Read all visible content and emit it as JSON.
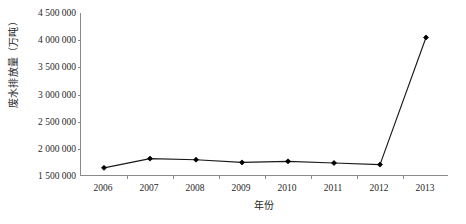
{
  "chart_data": {
    "type": "line",
    "title": "",
    "subtitle": "",
    "xlabel": "年份",
    "ylabel": "废水排放量（万吨）",
    "categories": [
      "2006",
      "2007",
      "2008",
      "2009",
      "2010",
      "2011",
      "2012",
      "2013"
    ],
    "values": [
      1650000,
      1820000,
      1800000,
      1750000,
      1770000,
      1740000,
      1710000,
      4050000
    ],
    "series": [
      {
        "name": "废水排放量",
        "values": [
          1650000,
          1820000,
          1800000,
          1750000,
          1770000,
          1740000,
          1710000,
          4050000
        ]
      }
    ],
    "ylim": [
      1500000,
      4500000
    ],
    "ytick_values": [
      1500000,
      2000000,
      2500000,
      3000000,
      3500000,
      4000000,
      4500000
    ],
    "ytick_labels": [
      "1 500 000",
      "2 000 000",
      "2 500 000",
      "3 000 000",
      "3 500 000",
      "4 000 000",
      "4 500 000"
    ],
    "xtick_labels": [
      "2006",
      "2007",
      "2008",
      "2009",
      "2010",
      "2011",
      "2012",
      "2013"
    ],
    "grid": false,
    "legend": false,
    "legend_position": "none",
    "line_color": "#1a1a1a",
    "marker_color": "#000000",
    "marker_shape": "diamond",
    "axis_color": "#8a8a8a",
    "background_color": "#ffffff"
  }
}
